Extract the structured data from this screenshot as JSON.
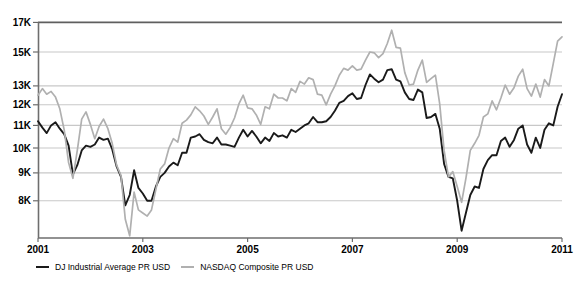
{
  "chart_data": {
    "type": "line",
    "title": "",
    "grid": "horizontal-only",
    "legend_position": "bottom-left",
    "x_axis": {
      "ticks": [
        "2001",
        "2003",
        "2005",
        "2007",
        "2009",
        "2011"
      ],
      "tick_values": [
        2001,
        2003,
        2005,
        2007,
        2009,
        2011
      ],
      "range": [
        2001,
        2011
      ]
    },
    "y_axis": {
      "scale": "log",
      "tick_labels": [
        "17K",
        "15K",
        "13K",
        "12K",
        "11K",
        "10K",
        "9K",
        "8K"
      ],
      "tick_values_k": [
        17,
        15,
        13,
        12,
        11,
        10,
        9,
        8
      ],
      "unit": "USD (thousands)",
      "top_k": 17,
      "bottom_k": 6.85
    },
    "sampling": "monthly",
    "x_start_year": 2001.0,
    "x_end_year": 2011.0,
    "series": [
      {
        "name": "DJ Industrial Average PR USD",
        "color": "#1a1a1a",
        "stroke_width": 1.9,
        "values_k": [
          11.2,
          10.9,
          10.65,
          11.0,
          11.15,
          10.85,
          10.6,
          10.1,
          8.95,
          9.3,
          9.9,
          10.1,
          10.05,
          10.15,
          10.45,
          10.35,
          10.4,
          9.95,
          9.25,
          8.85,
          7.85,
          8.2,
          9.1,
          8.45,
          8.25,
          8.0,
          8.0,
          8.5,
          8.85,
          9.0,
          9.25,
          9.4,
          9.3,
          9.8,
          9.8,
          10.45,
          10.5,
          10.6,
          10.35,
          10.25,
          10.2,
          10.45,
          10.15,
          10.15,
          10.1,
          10.05,
          10.45,
          10.8,
          10.5,
          10.75,
          10.5,
          10.2,
          10.45,
          10.3,
          10.65,
          10.5,
          10.55,
          10.45,
          10.8,
          10.7,
          10.85,
          11.0,
          11.1,
          11.4,
          11.15,
          11.15,
          11.2,
          11.4,
          11.7,
          12.1,
          12.2,
          12.45,
          12.6,
          12.3,
          12.35,
          13.05,
          13.65,
          13.4,
          13.2,
          13.35,
          13.9,
          13.95,
          13.35,
          13.25,
          12.65,
          12.3,
          12.25,
          12.8,
          12.65,
          11.35,
          11.4,
          11.55,
          10.85,
          9.35,
          8.85,
          8.8,
          8.0,
          7.05,
          7.6,
          8.2,
          8.5,
          8.45,
          9.15,
          9.5,
          9.7,
          9.7,
          10.3,
          10.45,
          10.05,
          10.35,
          10.85,
          11.0,
          10.15,
          9.8,
          10.45,
          10.0,
          10.8,
          11.1,
          11.0,
          11.9,
          12.55
        ]
      },
      {
        "name": "NASDAQ Composite PR USD",
        "color": "#b0b0b0",
        "stroke_width": 1.7,
        "values_k": [
          12.5,
          12.85,
          12.55,
          12.7,
          12.4,
          11.8,
          10.8,
          9.4,
          8.8,
          9.9,
          11.3,
          11.65,
          11.05,
          10.4,
          10.95,
          11.3,
          10.85,
          10.2,
          9.3,
          8.9,
          7.4,
          6.9,
          8.3,
          7.7,
          7.6,
          7.5,
          7.7,
          8.4,
          9.15,
          9.35,
          10.0,
          10.4,
          10.25,
          11.1,
          11.25,
          11.5,
          11.9,
          11.7,
          11.45,
          11.05,
          11.4,
          11.8,
          10.85,
          10.6,
          10.9,
          11.35,
          12.05,
          12.5,
          11.85,
          11.8,
          11.5,
          11.05,
          11.9,
          11.8,
          12.55,
          12.35,
          12.35,
          12.2,
          12.85,
          12.65,
          13.25,
          13.1,
          13.45,
          13.35,
          12.55,
          12.5,
          12.0,
          12.55,
          13.0,
          13.6,
          14.0,
          13.9,
          14.15,
          13.9,
          13.95,
          14.5,
          15.0,
          14.95,
          14.65,
          14.9,
          15.55,
          16.45,
          15.3,
          15.25,
          13.75,
          13.05,
          13.1,
          13.9,
          14.5,
          13.2,
          13.4,
          13.6,
          12.05,
          9.9,
          8.85,
          9.05,
          8.5,
          7.95,
          8.8,
          9.9,
          10.2,
          10.55,
          11.4,
          11.55,
          12.2,
          11.75,
          12.35,
          13.05,
          12.55,
          12.9,
          13.55,
          13.95,
          12.85,
          12.45,
          13.1,
          12.4,
          13.35,
          13.0,
          14.3,
          15.7,
          16.0
        ]
      }
    ]
  },
  "legend": {
    "items": [
      {
        "label": "DJ Industrial Average PR USD",
        "color": "#1a1a1a"
      },
      {
        "label": "NASDAQ Composite PR USD",
        "color": "#b0b0b0"
      }
    ]
  },
  "colors": {
    "background": "#ffffff",
    "gridline": "#c8c8c8",
    "top_gridline": "#5f5f5f",
    "axis": "#6e6e6e",
    "text": "#000000"
  }
}
